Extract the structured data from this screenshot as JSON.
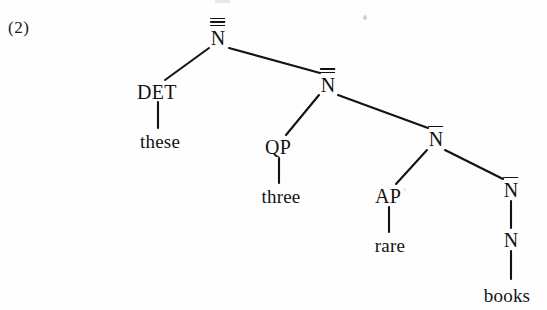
{
  "figure": {
    "example_number": "(2)",
    "caption": "",
    "ink_color": "#131313",
    "background_color": "#fefefe"
  },
  "chart_data": {
    "type": "diagram",
    "subtype": "syntax-tree",
    "title": "",
    "sentence": "these three rare books",
    "nodes": [
      {
        "id": "n-triple",
        "label": "N",
        "bars": 3,
        "kind": "category",
        "x": 218,
        "y": 38
      },
      {
        "id": "det",
        "label": "DET",
        "bars": 0,
        "kind": "category",
        "x": 157,
        "y": 92
      },
      {
        "id": "these",
        "label": "these",
        "bars": 0,
        "kind": "terminal",
        "x": 160,
        "y": 141
      },
      {
        "id": "n-double",
        "label": "N",
        "bars": 2,
        "kind": "category",
        "x": 328,
        "y": 85
      },
      {
        "id": "qp",
        "label": "QP",
        "bars": 0,
        "kind": "category",
        "x": 278,
        "y": 147
      },
      {
        "id": "three",
        "label": "three",
        "bars": 0,
        "kind": "terminal",
        "x": 281,
        "y": 196
      },
      {
        "id": "n-single-1",
        "label": "N",
        "bars": 1,
        "kind": "category",
        "x": 436,
        "y": 139
      },
      {
        "id": "ap",
        "label": "AP",
        "bars": 0,
        "kind": "category",
        "x": 388,
        "y": 196
      },
      {
        "id": "rare",
        "label": "rare",
        "bars": 0,
        "kind": "terminal",
        "x": 390,
        "y": 245
      },
      {
        "id": "n-single-2",
        "label": "N",
        "bars": 1,
        "kind": "category",
        "x": 511,
        "y": 190
      },
      {
        "id": "n-plain",
        "label": "N",
        "bars": 0,
        "kind": "category",
        "x": 511,
        "y": 240
      },
      {
        "id": "books",
        "label": "books",
        "bars": 0,
        "kind": "terminal",
        "x": 507,
        "y": 295
      }
    ],
    "edges": [
      {
        "from": "n-triple",
        "to": "det",
        "x1": 209,
        "y1": 48,
        "x2": 165,
        "y2": 80
      },
      {
        "from": "n-triple",
        "to": "n-double",
        "x1": 229,
        "y1": 48,
        "x2": 320,
        "y2": 73
      },
      {
        "from": "det",
        "to": "these",
        "x1": 158,
        "y1": 102,
        "x2": 158,
        "y2": 128
      },
      {
        "from": "n-double",
        "to": "qp",
        "x1": 319,
        "y1": 95,
        "x2": 286,
        "y2": 135
      },
      {
        "from": "n-double",
        "to": "n-single-1",
        "x1": 338,
        "y1": 95,
        "x2": 428,
        "y2": 128
      },
      {
        "from": "qp",
        "to": "three",
        "x1": 279,
        "y1": 158,
        "x2": 279,
        "y2": 183
      },
      {
        "from": "n-single-1",
        "to": "ap",
        "x1": 427,
        "y1": 150,
        "x2": 396,
        "y2": 184
      },
      {
        "from": "n-single-1",
        "to": "n-single-2",
        "x1": 445,
        "y1": 150,
        "x2": 503,
        "y2": 179
      },
      {
        "from": "ap",
        "to": "rare",
        "x1": 389,
        "y1": 207,
        "x2": 389,
        "y2": 232
      },
      {
        "from": "n-single-2",
        "to": "n-plain",
        "x1": 511,
        "y1": 201,
        "x2": 511,
        "y2": 228
      },
      {
        "from": "n-plain",
        "to": "books",
        "x1": 511,
        "y1": 251,
        "x2": 511,
        "y2": 279
      }
    ],
    "notes": [
      "Root is N with three overbars (N triple-bar).",
      "Second node is N with two overbars (N double-bar).",
      "Two distinct N single-bar nodes appear in the right branch.",
      "The lowest N has no overbar and dominates the word 'books'."
    ]
  },
  "artifacts": {
    "speck_label": "scan-speck",
    "top_clip_label": "clipped-glyph-above"
  }
}
